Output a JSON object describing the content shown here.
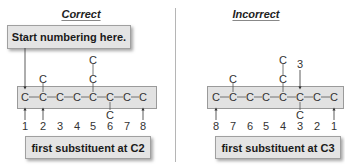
{
  "colors": {
    "box_fill": "#e4e4e4",
    "box_border": "#a0a0a0",
    "divider": "#b5b5b5",
    "text": "#222222"
  },
  "left_panel": {
    "title": "Correct",
    "callout": "Start numbering here.",
    "chain_atoms": [
      "C",
      "C",
      "C",
      "C",
      "C",
      "C",
      "C",
      "C"
    ],
    "substituents_above": [
      {
        "position": 2,
        "atoms": [
          "C"
        ]
      },
      {
        "position": 5,
        "atoms": [
          "C",
          "C"
        ]
      }
    ],
    "substituents_below": [
      {
        "position": 6,
        "atoms": [
          "C"
        ]
      }
    ],
    "numbers": [
      "1",
      "2",
      "3",
      "4",
      "5",
      "6",
      "7",
      "8"
    ],
    "arrows_at_numbers": [
      "1",
      "2",
      "8"
    ],
    "result": "first substituent at C2"
  },
  "right_panel": {
    "title": "Incorrect",
    "chain_atoms": [
      "C",
      "C",
      "C",
      "C",
      "C",
      "C",
      "C",
      "C"
    ],
    "substituents_above": [
      {
        "position": 7,
        "atoms": [
          "C"
        ]
      },
      {
        "position": 4,
        "atoms": [
          "C",
          "C"
        ]
      }
    ],
    "substituents_below": [
      {
        "position": 3,
        "atoms": [
          "C"
        ]
      }
    ],
    "numbers": [
      "8",
      "7",
      "6",
      "5",
      "4",
      "3",
      "2",
      "1"
    ],
    "top_pointer_label": "3",
    "arrows_at_numbers": [
      "8",
      "1"
    ],
    "result": "first substituent at C3"
  }
}
